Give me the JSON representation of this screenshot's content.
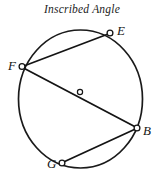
{
  "figure": {
    "title": "Inscribed Angle",
    "width": 164,
    "height": 182,
    "background_color": "#ffffff",
    "stroke_color": "#1a1a1a"
  },
  "geometry": {
    "circle": {
      "label": "circle",
      "center": {
        "x": 80.5,
        "y": 99
      },
      "radius_x": 62,
      "radius_y": 69,
      "stroke_width": 1.6
    },
    "center_marker": {
      "name": "center-point",
      "x": 80,
      "y": 92,
      "radius": 2.6,
      "label": ""
    },
    "points": [
      {
        "id": "E",
        "label": "E",
        "x": 110,
        "y": 33,
        "label_x": 117,
        "label_y": 24
      },
      {
        "id": "F",
        "label": "F",
        "x": 22,
        "y": 66,
        "label_x": 8,
        "label_y": 59
      },
      {
        "id": "B",
        "label": "B",
        "x": 137,
        "y": 128,
        "label_x": 143,
        "label_y": 124
      },
      {
        "id": "G",
        "label": "G",
        "x": 62,
        "y": 163,
        "label_x": 47,
        "label_y": 157
      }
    ],
    "chords": [
      {
        "id": "FE",
        "from": "F",
        "to": "E",
        "label": "chord F to E"
      },
      {
        "id": "FB",
        "from": "F",
        "to": "B",
        "label": "chord F to B (through near center)"
      },
      {
        "id": "BG",
        "from": "B",
        "to": "G",
        "label": "chord B to G"
      }
    ]
  }
}
